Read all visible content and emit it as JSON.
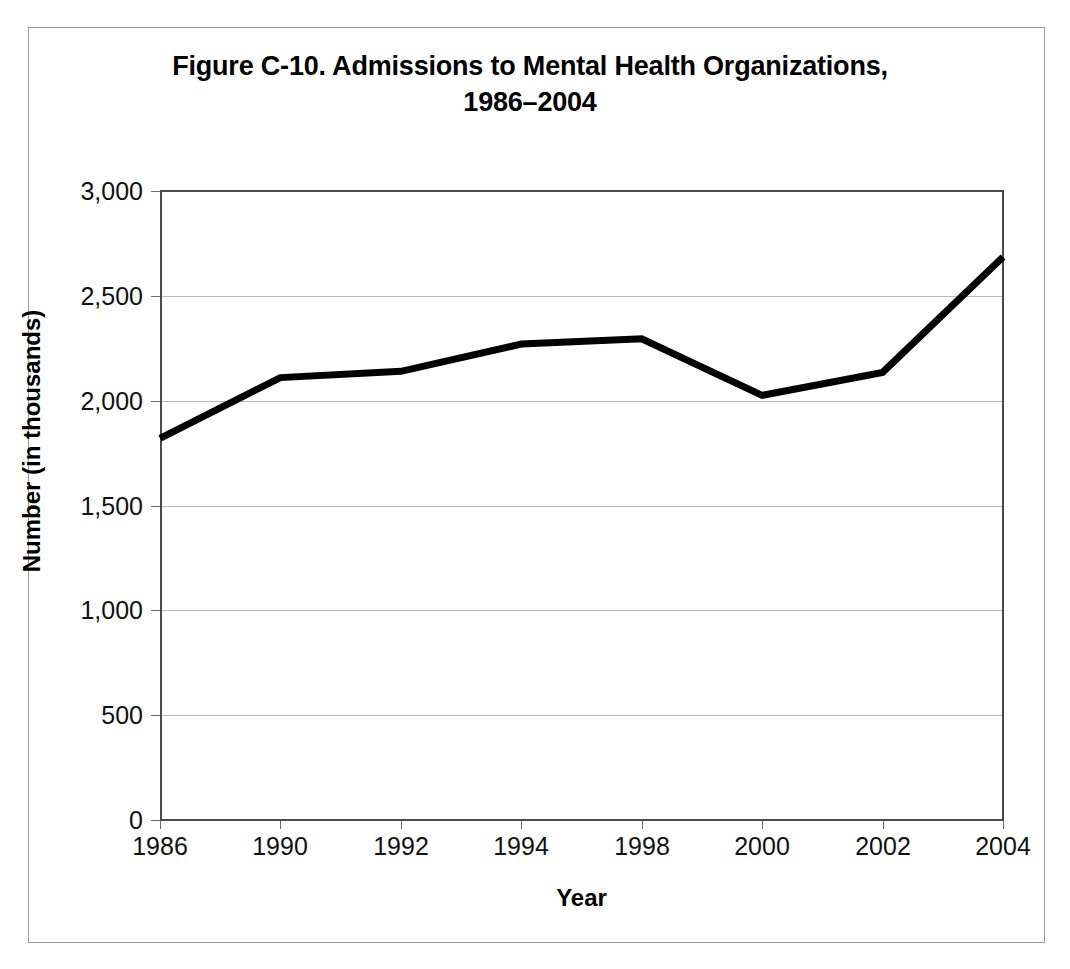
{
  "figure": {
    "title_line1": "Figure C-10. Admissions to Mental Health Organizations,",
    "title_line2": "1986–2004"
  },
  "chart_data": {
    "type": "line",
    "title": "Figure C-10. Admissions to Mental Health Organizations, 1986–2004",
    "xlabel": "Year",
    "ylabel": "Number (in thousands)",
    "categories": [
      "1986",
      "1990",
      "1992",
      "1994",
      "1998",
      "2000",
      "2002",
      "2004"
    ],
    "values": [
      1820,
      2110,
      2140,
      2270,
      2295,
      2025,
      2135,
      2685
    ],
    "series": [
      {
        "name": "Admissions",
        "values": [
          1820,
          2110,
          2140,
          2270,
          2295,
          2025,
          2135,
          2685
        ],
        "color": "#000000"
      }
    ],
    "ylim": [
      0,
      3000
    ],
    "yticks": [
      0,
      500,
      1000,
      1500,
      2000,
      2500,
      3000
    ],
    "ytick_labels": [
      "0",
      "500",
      "1,000",
      "1,500",
      "2,000",
      "2,500",
      "3,000"
    ],
    "grid": "horizontal",
    "legend": "none"
  }
}
